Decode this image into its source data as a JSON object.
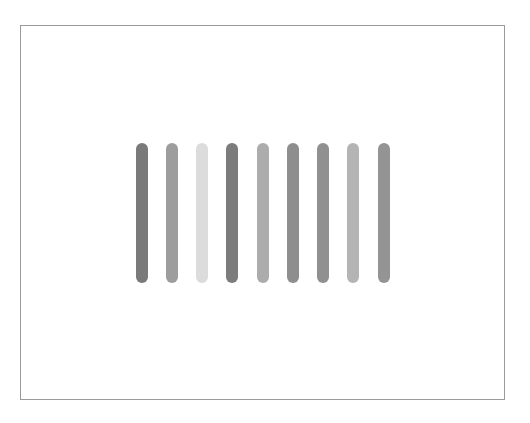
{
  "frame": {
    "border_color": "#9a9a9a",
    "background": "#ffffff"
  },
  "bars": [
    {
      "index": 1,
      "color": "#7a7a7a"
    },
    {
      "index": 2,
      "color": "#9d9d9d"
    },
    {
      "index": 3,
      "color": "#dcdcdc"
    },
    {
      "index": 4,
      "color": "#7c7c7c"
    },
    {
      "index": 5,
      "color": "#acacac"
    },
    {
      "index": 6,
      "color": "#8e8e8e"
    },
    {
      "index": 7,
      "color": "#909090"
    },
    {
      "index": 8,
      "color": "#b4b4b4"
    },
    {
      "index": 9,
      "color": "#949494"
    }
  ]
}
